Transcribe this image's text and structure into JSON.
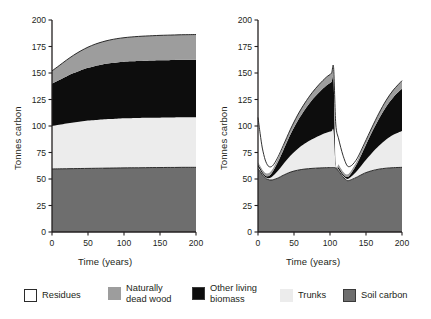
{
  "figure": {
    "background": "#ffffff",
    "panels": [
      "unmanaged",
      "managed"
    ]
  },
  "axes": {
    "ylabel": "Tonnes carbon",
    "xlabel": "Time (years)",
    "yticks": [
      "0",
      "25",
      "50",
      "75",
      "100",
      "125",
      "150",
      "175",
      "200"
    ],
    "xticks": [
      "0",
      "50",
      "100",
      "150",
      "200"
    ],
    "ylim": [
      0,
      200
    ],
    "xlim": [
      0,
      200
    ],
    "grid": false
  },
  "legend": {
    "position": "bottom",
    "items": [
      {
        "label": "Residues",
        "color": "#ffffff",
        "swatch": "sw-residues",
        "icon": "residues-swatch-icon"
      },
      {
        "label": "Naturally\ndead wood",
        "color": "#9d9d9d",
        "swatch": "sw-dead",
        "icon": "dead-wood-swatch-icon"
      },
      {
        "label": "Other living\nbiomass",
        "color": "#0d0d0d",
        "swatch": "sw-biomass",
        "icon": "living-biomass-swatch-icon"
      },
      {
        "label": "Trunks",
        "color": "#ececec",
        "swatch": "sw-trunks",
        "icon": "trunks-swatch-icon"
      },
      {
        "label": "Soil carbon",
        "color": "#6e6e6e",
        "swatch": "sw-soil",
        "icon": "soil-carbon-swatch-icon"
      }
    ]
  },
  "chart_data": [
    {
      "type": "area",
      "id": "unmanaged-forest",
      "title": "",
      "xlabel": "Time (years)",
      "ylabel": "Tonnes carbon",
      "xlim": [
        0,
        200
      ],
      "ylim": [
        0,
        200
      ],
      "xticks": [
        0,
        50,
        100,
        150,
        200
      ],
      "yticks": [
        0,
        25,
        50,
        75,
        100,
        125,
        150,
        175,
        200
      ],
      "stacked": true,
      "grid": false,
      "x": [
        0,
        10,
        20,
        30,
        40,
        50,
        60,
        70,
        80,
        90,
        100,
        110,
        120,
        130,
        140,
        150,
        160,
        170,
        180,
        190,
        200
      ],
      "series": [
        {
          "name": "Soil carbon",
          "color": "#6e6e6e",
          "values": [
            59.5,
            59.6,
            59.7,
            59.8,
            59.9,
            60.0,
            60.1,
            60.2,
            60.3,
            60.4,
            60.5,
            60.6,
            60.6,
            60.7,
            60.8,
            60.8,
            60.9,
            60.9,
            61.0,
            61.0,
            61.0
          ]
        },
        {
          "name": "Trunks",
          "color": "#ececec",
          "values": [
            40.5,
            41.5,
            42.6,
            43.6,
            44.4,
            45.1,
            45.6,
            46.0,
            46.3,
            46.5,
            46.7,
            46.8,
            46.9,
            47.0,
            47.0,
            47.1,
            47.1,
            47.2,
            47.2,
            47.2,
            47.3
          ]
        },
        {
          "name": "Other living biomass",
          "color": "#0d0d0d",
          "values": [
            40.0,
            42.3,
            44.5,
            46.5,
            48.3,
            49.8,
            51.0,
            51.9,
            52.6,
            53.1,
            53.4,
            53.6,
            53.8,
            53.9,
            54.0,
            54.1,
            54.1,
            54.2,
            54.2,
            54.3,
            54.3
          ]
        },
        {
          "name": "Naturally dead wood",
          "color": "#9d9d9d",
          "values": [
            12.0,
            13.6,
            15.3,
            16.9,
            18.3,
            19.5,
            20.5,
            21.3,
            21.9,
            22.4,
            22.7,
            23.0,
            23.2,
            23.3,
            23.4,
            23.5,
            23.6,
            23.6,
            23.7,
            23.7,
            23.7
          ]
        },
        {
          "name": "Residues",
          "color": "#ffffff",
          "values": [
            0,
            0,
            0,
            0,
            0,
            0,
            0,
            0,
            0,
            0,
            0,
            0,
            0,
            0,
            0,
            0,
            0,
            0,
            0,
            0,
            0
          ]
        }
      ],
      "totals": [
        152,
        157,
        162.1,
        166.8,
        170.9,
        174.4,
        177.2,
        179.4,
        181.1,
        182.4,
        183.3,
        184.0,
        184.5,
        184.9,
        185.2,
        185.5,
        185.7,
        185.9,
        186.1,
        186.2,
        186.3
      ]
    },
    {
      "type": "area",
      "id": "managed-forest",
      "title": "",
      "xlabel": "Time (years)",
      "ylabel": "Tonnes carbon",
      "xlim": [
        0,
        200
      ],
      "ylim": [
        0,
        200
      ],
      "xticks": [
        0,
        50,
        100,
        150,
        200
      ],
      "yticks": [
        0,
        25,
        50,
        75,
        100,
        125,
        150,
        175,
        200
      ],
      "stacked": true,
      "grid": false,
      "harvest_years": [
        0,
        105,
        200
      ],
      "annotations": [
        {
          "text": "harvest drawdown",
          "x": 0,
          "y": 108
        },
        {
          "text": "minimum",
          "x": 16,
          "y": 73
        },
        {
          "text": "peak before harvest",
          "x": 104,
          "y": 155
        },
        {
          "text": "second minimum",
          "x": 123,
          "y": 76
        },
        {
          "text": "end of rotation",
          "x": 200,
          "y": 145
        }
      ],
      "x": [
        0,
        3,
        6,
        10,
        14,
        18,
        22,
        28,
        35,
        45,
        55,
        65,
        75,
        85,
        95,
        102,
        105,
        108,
        112,
        118,
        124,
        130,
        138,
        148,
        158,
        168,
        178,
        188,
        200
      ],
      "series": [
        {
          "name": "Soil carbon",
          "color": "#6e6e6e",
          "values": [
            59.5,
            57.0,
            54.0,
            51.0,
            49.5,
            49.0,
            49.5,
            51.0,
            53.5,
            56.5,
            58.3,
            59.4,
            60.0,
            60.4,
            60.7,
            60.8,
            60.8,
            60.4,
            57.5,
            52.0,
            48.5,
            49.5,
            52.0,
            55.5,
            57.8,
            59.3,
            60.2,
            60.7,
            61.0
          ]
        },
        {
          "name": "Trunks",
          "color": "#ececec",
          "values": [
            2.0,
            1.5,
            1.2,
            1.0,
            1.3,
            2.5,
            4.2,
            7.0,
            10.5,
            15.5,
            20.0,
            24.0,
            27.5,
            30.5,
            33.0,
            34.3,
            34.5,
            2.0,
            1.5,
            1.2,
            1.5,
            3.0,
            6.0,
            11.0,
            16.5,
            22.0,
            27.0,
            31.0,
            34.3
          ]
        },
        {
          "name": "Other living biomass",
          "color": "#0d0d0d",
          "values": [
            2.5,
            2.0,
            1.6,
            1.4,
            1.8,
            3.0,
            5.0,
            8.5,
            13.0,
            20.0,
            26.5,
            32.0,
            37.0,
            41.0,
            44.5,
            46.5,
            47.0,
            2.5,
            2.0,
            1.6,
            1.8,
            3.5,
            7.0,
            13.0,
            19.5,
            25.5,
            31.0,
            35.5,
            40.0
          ]
        },
        {
          "name": "Naturally dead wood",
          "color": "#9d9d9d",
          "values": [
            2.0,
            2.2,
            2.4,
            2.6,
            2.8,
            3.0,
            3.2,
            3.6,
            4.0,
            4.8,
            5.5,
            6.2,
            6.8,
            7.4,
            7.9,
            8.2,
            8.3,
            3.0,
            2.8,
            2.6,
            2.6,
            2.8,
            3.2,
            3.8,
            4.5,
            5.3,
            6.1,
            6.8,
            7.5
          ]
        },
        {
          "name": "Residues",
          "color": "#ffffff",
          "values": [
            42.0,
            30.0,
            20.0,
            12.0,
            7.0,
            4.0,
            2.0,
            1.0,
            0.5,
            0,
            0,
            0,
            0,
            0,
            0,
            0,
            4.5,
            34.0,
            24.0,
            15.0,
            8.0,
            4.0,
            1.5,
            0.5,
            0,
            0,
            0,
            0,
            0
          ]
        }
      ],
      "totals": [
        108,
        92.7,
        79.2,
        68.0,
        62.4,
        61.5,
        63.9,
        71.1,
        81.5,
        96.8,
        110.3,
        121.6,
        131.3,
        139.3,
        146.1,
        149.8,
        155.1,
        101.9,
        87.8,
        72.4,
        62.4,
        62.8,
        69.7,
        83.8,
        98.3,
        112.1,
        124.3,
        134.0,
        142.8
      ]
    }
  ]
}
